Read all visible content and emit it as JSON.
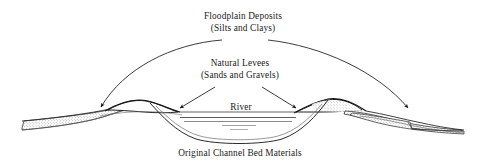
{
  "figure": {
    "type": "cross-section-diagram",
    "background_color": "#ffffff",
    "line_color": "#1a1a1a",
    "stipple_color": "#8a8a8a"
  },
  "labels": {
    "floodplain_line1": "Floodplain Deposits",
    "floodplain_line2": "(Silts and Clays)",
    "levees_line1": "Natural Levees",
    "levees_line2": "(Sands and Gravels)",
    "river": "River",
    "bed_materials": "Original Channel Bed Materials"
  },
  "annotations": {
    "floodplain_arrow_left": "curved-arrow-to-left-floodplain",
    "floodplain_arrow_right": "curved-arrow-to-right-floodplain",
    "levee_arrow_left": "straight-arrow-to-left-levee",
    "levee_arrow_right": "straight-arrow-to-right-levee"
  },
  "features": {
    "left_floodplain": "stippled wedge deposit left of channel",
    "right_floodplain": "stippled wedge deposit right of channel",
    "left_levee": "mound of sands and gravels on left bank",
    "right_levee": "mound of sands and gravels on right bank",
    "channel": "incised river channel",
    "water_surface": "river water surface lines",
    "bed_line": "original channel bed profile"
  }
}
